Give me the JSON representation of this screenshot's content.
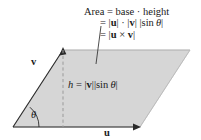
{
  "figure": {
    "colors": {
      "fill": "#d6d6d6",
      "outline": "#8c8c8c",
      "ink": "#1a1a1a",
      "dashed": "#9a9a9a",
      "background": "#ffffff"
    },
    "formula": {
      "line1": "Area = base · height",
      "line2": "= |u| · |v| |sin θ|",
      "line2_parts": {
        "eq": "=",
        "bar_open_u": "|",
        "u": "u",
        "bar_close_u": "|",
        "dot": "·",
        "bar_open_v": "|",
        "v": "v",
        "bar_close_v": "|",
        "bar_open_sin": "|",
        "sin": "sin",
        "theta": "θ",
        "bar_close_sin": "|"
      },
      "line3": "= |u × v|",
      "line3_parts": {
        "eq": "=",
        "bar_open": "|",
        "u": "u",
        "cross": "×",
        "v": "v",
        "bar_close": "|"
      }
    },
    "labels": {
      "vector_v": "v",
      "vector_u": "u",
      "angle": "θ",
      "height": {
        "h": "h",
        "eq": "=",
        "bar_open_v": "|",
        "v": "v",
        "bar_close_v": "|",
        "bar_open_sin": "|",
        "sin": "sin",
        "theta": "θ",
        "bar_close_sin": "|"
      }
    },
    "geometry": {
      "parallelogram_points": "13,127 63,50 190,50 140,127",
      "vector_u_from": [
        13,
        127
      ],
      "vector_u_to": [
        140,
        127
      ],
      "vector_v_from": [
        13,
        127
      ],
      "vector_v_to": [
        63,
        50
      ],
      "height_line_x": 63,
      "height_line_from_y": 50,
      "height_line_to_y": 127,
      "leader_from": [
        101,
        26
      ],
      "leader_to": [
        96,
        64
      ],
      "angle_arc_radius": 26
    }
  }
}
